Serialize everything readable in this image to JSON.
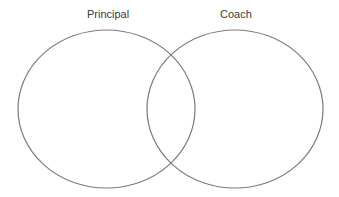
{
  "diagram": {
    "type": "venn",
    "stroke_color": "#7a7a7a",
    "sets": [
      {
        "label": "Principal",
        "cx": 106.5,
        "cy": 109,
        "rx": 88.5,
        "ry": 79
      },
      {
        "label": "Coach",
        "cx": 235,
        "cy": 109,
        "rx": 88,
        "ry": 79
      }
    ]
  }
}
